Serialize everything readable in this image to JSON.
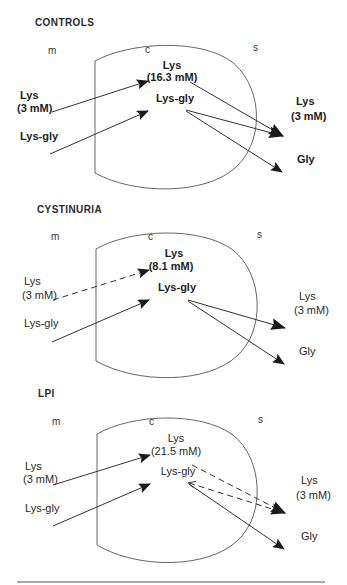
{
  "figure": {
    "colors": {
      "line": "#3a3a3a",
      "arrowhead": "#1a1a1a",
      "cell_outline": "#555555",
      "text": "#2a2a2a",
      "rule": "#555555"
    },
    "panels": [
      {
        "title": "CONTROLS",
        "compartments": {
          "mucosal": "m",
          "cell": "c",
          "serosal": "s"
        },
        "mucosal": {
          "lys_label": "Lys",
          "lys_conc": "(3 mM)",
          "dipeptide": "Lys-gly"
        },
        "cell": {
          "lys_label": "Lys",
          "lys_conc": "(16.3 mM)",
          "dipeptide": "Lys-gly"
        },
        "serosal": {
          "lys_label": "Lys",
          "lys_conc": "(3 mM)",
          "gly": "Gly"
        },
        "fluxes": {
          "lys_influx": "solid",
          "dipeptide_influx": "solid",
          "lys_efflux": "solid",
          "dipeptide_lys_efflux": "solid",
          "gly_efflux": "solid"
        }
      },
      {
        "title": "CYSTINURIA",
        "compartments": {
          "mucosal": "m",
          "cell": "c",
          "serosal": "s"
        },
        "mucosal": {
          "lys_label": "Lys",
          "lys_conc": "(3 mM)",
          "dipeptide": "Lys-gly"
        },
        "cell": {
          "lys_label": "Lys",
          "lys_conc": "(8.1 mM)",
          "dipeptide": "Lys-gly"
        },
        "serosal": {
          "lys_label": "Lys",
          "lys_conc": "(3 mM)",
          "gly": "Gly"
        },
        "fluxes": {
          "lys_influx": "dashed",
          "dipeptide_influx": "solid",
          "dipeptide_lys_efflux": "solid",
          "gly_efflux": "solid"
        }
      },
      {
        "title": "LPI",
        "compartments": {
          "mucosal": "m",
          "cell": "c",
          "serosal": "s"
        },
        "mucosal": {
          "lys_label": "Lys",
          "lys_conc": "(3 mM)",
          "dipeptide": "Lys-gly"
        },
        "cell": {
          "lys_label": "Lys",
          "lys_conc": "(21.5 mM)",
          "dipeptide": "Lys-gly"
        },
        "serosal": {
          "lys_label": "Lys",
          "lys_conc": "(3 mM)",
          "gly": "Gly"
        },
        "fluxes": {
          "lys_influx": "solid",
          "dipeptide_influx": "solid",
          "lys_efflux": "dashed",
          "dipeptide_lys_efflux": "dashed",
          "gly_efflux": "solid"
        }
      }
    ]
  }
}
